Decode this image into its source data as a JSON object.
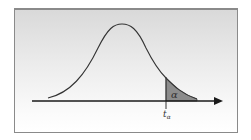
{
  "diagram": {
    "type": "normal-distribution-right-tail",
    "shaded_region_label": "α",
    "critical_value_label": "t",
    "critical_value_subscript": "α",
    "colors": {
      "curve": "#333333",
      "axis": "#1a1a1a",
      "shade": "#8c8c8c",
      "frame_border": "#8a8a8a",
      "background_top": "#d9d9d9",
      "background_bottom": "#ffffff"
    }
  }
}
